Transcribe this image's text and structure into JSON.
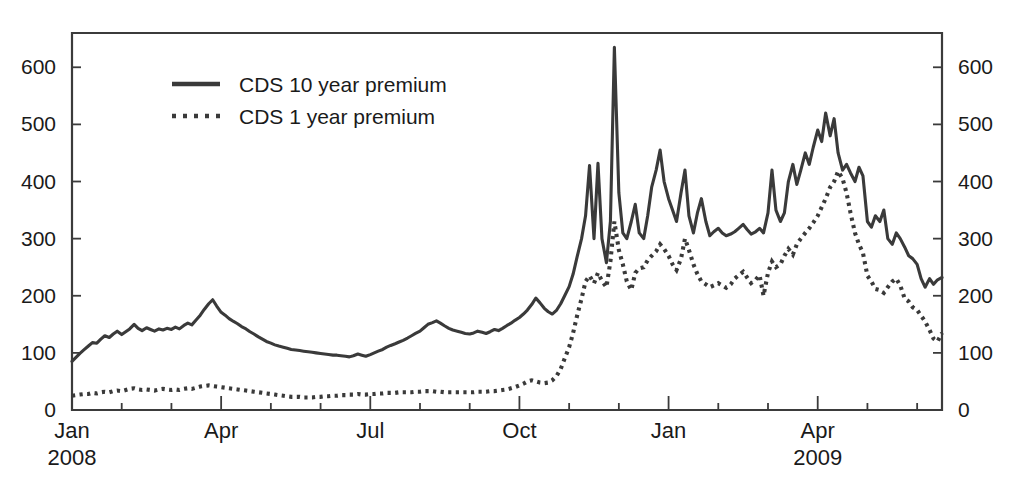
{
  "chart_data": {
    "type": "line",
    "title": "",
    "subtitle": "",
    "xlabel": "",
    "ylabel": "",
    "ylim": [
      0,
      660
    ],
    "yticks": [
      0,
      100,
      200,
      300,
      400,
      500,
      600
    ],
    "ytick_labels_left": [
      "0",
      "100",
      "200",
      "300",
      "400",
      "500",
      "600"
    ],
    "ytick_labels_right": [
      "0",
      "100",
      "200",
      "300",
      "400",
      "500",
      "600"
    ],
    "y_axis_both_sides": true,
    "grid": false,
    "legend_position": "upper-left-inside",
    "x_axis_type": "date-monthly",
    "x_range": [
      "2008-01",
      "2009-06"
    ],
    "xtick_major_labels": [
      {
        "label": "Jan",
        "year": "2008",
        "index": 0
      },
      {
        "label": "Apr",
        "year": "",
        "index": 3
      },
      {
        "label": "Jul",
        "year": "",
        "index": 6
      },
      {
        "label": "Oct",
        "year": "",
        "index": 9
      },
      {
        "label": "Jan",
        "year": "",
        "index": 12
      },
      {
        "label": "Apr",
        "year": "2009",
        "index": 15
      }
    ],
    "xtick_minor_count_per_quarter": 3,
    "series": [
      {
        "name": "CDS 10 year premium",
        "style": "solid",
        "color": "#3a3a3a",
        "x": [
          0.0,
          0.08,
          0.16,
          0.25,
          0.33,
          0.41,
          0.5,
          0.58,
          0.66,
          0.75,
          0.83,
          0.91,
          1.0,
          1.08,
          1.16,
          1.25,
          1.33,
          1.41,
          1.5,
          1.58,
          1.66,
          1.75,
          1.83,
          1.91,
          2.0,
          2.08,
          2.16,
          2.25,
          2.33,
          2.41,
          2.5,
          2.58,
          2.66,
          2.75,
          2.83,
          2.91,
          3.0,
          3.08,
          3.16,
          3.25,
          3.33,
          3.41,
          3.5,
          3.58,
          3.66,
          3.75,
          3.83,
          3.91,
          4.0,
          4.08,
          4.16,
          4.25,
          4.33,
          4.41,
          4.5,
          4.58,
          4.66,
          4.75,
          4.83,
          4.91,
          5.0,
          5.08,
          5.16,
          5.25,
          5.33,
          5.41,
          5.5,
          5.58,
          5.66,
          5.75,
          5.83,
          5.91,
          6.0,
          6.08,
          6.16,
          6.25,
          6.33,
          6.41,
          6.5,
          6.58,
          6.66,
          6.75,
          6.83,
          6.91,
          7.0,
          7.08,
          7.16,
          7.25,
          7.33,
          7.41,
          7.5,
          7.58,
          7.66,
          7.75,
          7.83,
          7.91,
          8.0,
          8.08,
          8.16,
          8.25,
          8.33,
          8.41,
          8.5,
          8.58,
          8.66,
          8.75,
          8.83,
          8.91,
          9.0,
          9.08,
          9.16,
          9.25,
          9.33,
          9.41,
          9.5,
          9.58,
          9.66,
          9.75,
          9.83,
          9.91,
          10.0,
          10.08,
          10.16,
          10.25,
          10.33,
          10.41,
          10.5,
          10.58,
          10.66,
          10.75,
          10.83,
          10.91,
          11.0,
          11.08,
          11.16,
          11.25,
          11.33,
          11.41,
          11.5,
          11.58,
          11.66,
          11.75,
          11.83,
          11.91,
          12.0,
          12.08,
          12.16,
          12.25,
          12.33,
          12.41,
          12.5,
          12.58,
          12.66,
          12.75,
          12.83,
          12.91,
          13.0,
          13.08,
          13.16,
          13.25,
          13.33,
          13.41,
          13.5,
          13.58,
          13.66,
          13.75,
          13.83,
          13.91,
          14.0,
          14.08,
          14.16,
          14.25,
          14.33,
          14.41,
          14.5,
          14.58,
          14.66,
          14.75,
          14.83,
          14.91,
          15.0,
          15.08,
          15.16,
          15.25,
          15.33,
          15.41,
          15.5,
          15.58,
          15.66,
          15.75,
          15.83,
          15.91,
          16.0,
          16.08,
          16.16,
          16.25,
          16.33,
          16.41,
          16.5,
          16.58,
          16.66,
          16.75,
          16.83,
          16.91,
          17.0,
          17.08,
          17.16,
          17.25,
          17.33,
          17.41,
          17.5
        ],
        "values": [
          85,
          92,
          99,
          106,
          112,
          118,
          117,
          124,
          130,
          127,
          133,
          138,
          132,
          137,
          142,
          150,
          143,
          139,
          144,
          141,
          138,
          142,
          140,
          143,
          141,
          145,
          142,
          148,
          152,
          149,
          158,
          166,
          176,
          186,
          193,
          182,
          171,
          166,
          160,
          155,
          151,
          146,
          142,
          137,
          133,
          128,
          124,
          120,
          117,
          114,
          112,
          110,
          108,
          106,
          105,
          104,
          103,
          102,
          101,
          100,
          99,
          98,
          97,
          96,
          96,
          95,
          94,
          93,
          95,
          98,
          96,
          94,
          97,
          100,
          103,
          106,
          110,
          113,
          116,
          119,
          122,
          126,
          130,
          134,
          138,
          144,
          150,
          153,
          156,
          152,
          147,
          143,
          140,
          138,
          136,
          134,
          133,
          135,
          138,
          136,
          134,
          137,
          141,
          139,
          143,
          148,
          152,
          157,
          162,
          168,
          175,
          185,
          196,
          188,
          178,
          172,
          168,
          175,
          186,
          200,
          216,
          238,
          268,
          300,
          340,
          428,
          300,
          432,
          300,
          258,
          330,
          635,
          380,
          310,
          300,
          330,
          360,
          310,
          300,
          340,
          390,
          420,
          455,
          400,
          370,
          350,
          330,
          380,
          420,
          340,
          310,
          345,
          370,
          330,
          305,
          312,
          318,
          310,
          305,
          308,
          312,
          318,
          325,
          316,
          308,
          312,
          318,
          310,
          345,
          420,
          350,
          330,
          345,
          400,
          430,
          395,
          420,
          450,
          430,
          460,
          490,
          470,
          520,
          480,
          510,
          450,
          420,
          430,
          415,
          400,
          425,
          410,
          330,
          320,
          340,
          330,
          350,
          300,
          290,
          310,
          300,
          285,
          270,
          265,
          255,
          230,
          215,
          230,
          220,
          228,
          232
        ]
      },
      {
        "name": "CDS 1 year premium",
        "style": "dotted",
        "color": "#3a3a3a",
        "x": [
          0.0,
          0.08,
          0.16,
          0.25,
          0.33,
          0.41,
          0.5,
          0.58,
          0.66,
          0.75,
          0.83,
          0.91,
          1.0,
          1.08,
          1.16,
          1.25,
          1.33,
          1.41,
          1.5,
          1.58,
          1.66,
          1.75,
          1.83,
          1.91,
          2.0,
          2.08,
          2.16,
          2.25,
          2.33,
          2.41,
          2.5,
          2.58,
          2.66,
          2.75,
          2.83,
          2.91,
          3.0,
          3.08,
          3.16,
          3.25,
          3.33,
          3.41,
          3.5,
          3.58,
          3.66,
          3.75,
          3.83,
          3.91,
          4.0,
          4.08,
          4.16,
          4.25,
          4.33,
          4.41,
          4.5,
          4.58,
          4.66,
          4.75,
          4.83,
          4.91,
          5.0,
          5.08,
          5.16,
          5.25,
          5.33,
          5.41,
          5.5,
          5.58,
          5.66,
          5.75,
          5.83,
          5.91,
          6.0,
          6.08,
          6.16,
          6.25,
          6.33,
          6.41,
          6.5,
          6.58,
          6.66,
          6.75,
          6.83,
          6.91,
          7.0,
          7.08,
          7.16,
          7.25,
          7.33,
          7.41,
          7.5,
          7.58,
          7.66,
          7.75,
          7.83,
          7.91,
          8.0,
          8.08,
          8.16,
          8.25,
          8.33,
          8.41,
          8.5,
          8.58,
          8.66,
          8.75,
          8.83,
          8.91,
          9.0,
          9.08,
          9.16,
          9.25,
          9.33,
          9.41,
          9.5,
          9.58,
          9.66,
          9.75,
          9.83,
          9.91,
          10.0,
          10.08,
          10.16,
          10.25,
          10.33,
          10.41,
          10.5,
          10.58,
          10.66,
          10.75,
          10.83,
          10.91,
          11.0,
          11.08,
          11.16,
          11.25,
          11.33,
          11.41,
          11.5,
          11.58,
          11.66,
          11.75,
          11.83,
          11.91,
          12.0,
          12.08,
          12.16,
          12.25,
          12.33,
          12.41,
          12.5,
          12.58,
          12.66,
          12.75,
          12.83,
          12.91,
          13.0,
          13.08,
          13.16,
          13.25,
          13.33,
          13.41,
          13.5,
          13.58,
          13.66,
          13.75,
          13.83,
          13.91,
          14.0,
          14.08,
          14.16,
          14.25,
          14.33,
          14.41,
          14.5,
          14.58,
          14.66,
          14.75,
          14.83,
          14.91,
          15.0,
          15.08,
          15.16,
          15.25,
          15.33,
          15.41,
          15.5,
          15.58,
          15.66,
          15.75,
          15.83,
          15.91,
          16.0,
          16.08,
          16.16,
          16.25,
          16.33,
          16.41,
          16.5,
          16.58,
          16.66,
          16.75,
          16.83,
          16.91,
          17.0,
          17.08,
          17.16,
          17.25,
          17.33,
          17.41,
          17.5
        ],
        "values": [
          25,
          26,
          27,
          28,
          28,
          30,
          29,
          31,
          32,
          31,
          33,
          34,
          33,
          35,
          37,
          38,
          36,
          35,
          36,
          35,
          34,
          36,
          37,
          36,
          35,
          36,
          35,
          37,
          38,
          37,
          39,
          41,
          42,
          43,
          42,
          41,
          40,
          39,
          38,
          37,
          36,
          35,
          34,
          33,
          32,
          31,
          30,
          29,
          28,
          27,
          26,
          25,
          24,
          23,
          23,
          23,
          22,
          22,
          22,
          23,
          23,
          24,
          24,
          25,
          25,
          26,
          26,
          27,
          27,
          28,
          27,
          27,
          28,
          28,
          29,
          29,
          30,
          30,
          30,
          31,
          31,
          31,
          31,
          32,
          32,
          33,
          33,
          33,
          32,
          32,
          31,
          31,
          31,
          31,
          31,
          31,
          31,
          31,
          32,
          32,
          32,
          33,
          33,
          34,
          35,
          36,
          38,
          40,
          43,
          46,
          50,
          52,
          50,
          48,
          47,
          48,
          52,
          60,
          72,
          90,
          110,
          135,
          165,
          195,
          225,
          235,
          222,
          240,
          226,
          215,
          260,
          330,
          280,
          255,
          225,
          210,
          240,
          248,
          250,
          262,
          270,
          278,
          290,
          282,
          270,
          255,
          245,
          265,
          300,
          280,
          255,
          238,
          225,
          220,
          215,
          218,
          222,
          218,
          214,
          220,
          230,
          236,
          242,
          232,
          222,
          228,
          236,
          200,
          240,
          260,
          250,
          255,
          270,
          282,
          272,
          290,
          300,
          310,
          318,
          328,
          340,
          355,
          370,
          390,
          400,
          418,
          405,
          380,
          345,
          310,
          290,
          275,
          235,
          225,
          212,
          210,
          205,
          215,
          225,
          230,
          218,
          195,
          190,
          180,
          175,
          165,
          155,
          140,
          125,
          120,
          135
        ]
      }
    ]
  },
  "legend": {
    "items": [
      {
        "label": "CDS 10 year premium",
        "style": "solid"
      },
      {
        "label": "CDS 1 year premium",
        "style": "dotted"
      }
    ]
  },
  "axes": {
    "left_labels": [
      "600",
      "500",
      "400",
      "300",
      "200",
      "100",
      "0"
    ],
    "right_labels": [
      "600",
      "500",
      "400",
      "300",
      "200",
      "100",
      "0"
    ],
    "bottom_months": [
      "Jan",
      "Apr",
      "Jul",
      "Oct",
      "Jan",
      "Apr"
    ],
    "bottom_years": [
      "2008",
      "2009"
    ]
  },
  "colors": {
    "line": "#3a3a3a",
    "axis": "#3b3b3b",
    "text": "#1a1a1a",
    "background": "#ffffff"
  }
}
